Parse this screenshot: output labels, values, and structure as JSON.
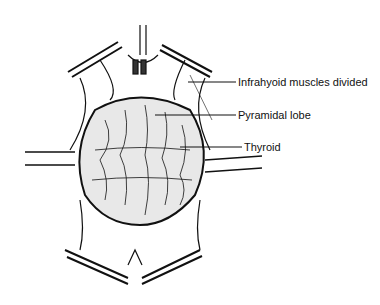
{
  "diagram": {
    "type": "surgical-anatomy-illustration",
    "labels": [
      {
        "id": "infrahyoid",
        "text": "Infrahyoid muscles divided"
      },
      {
        "id": "pyramidal",
        "text": "Pyramidal lobe"
      },
      {
        "id": "thyroid",
        "text": "Thyroid"
      }
    ],
    "colors": {
      "ink": "#111111",
      "background": "#ffffff"
    }
  }
}
